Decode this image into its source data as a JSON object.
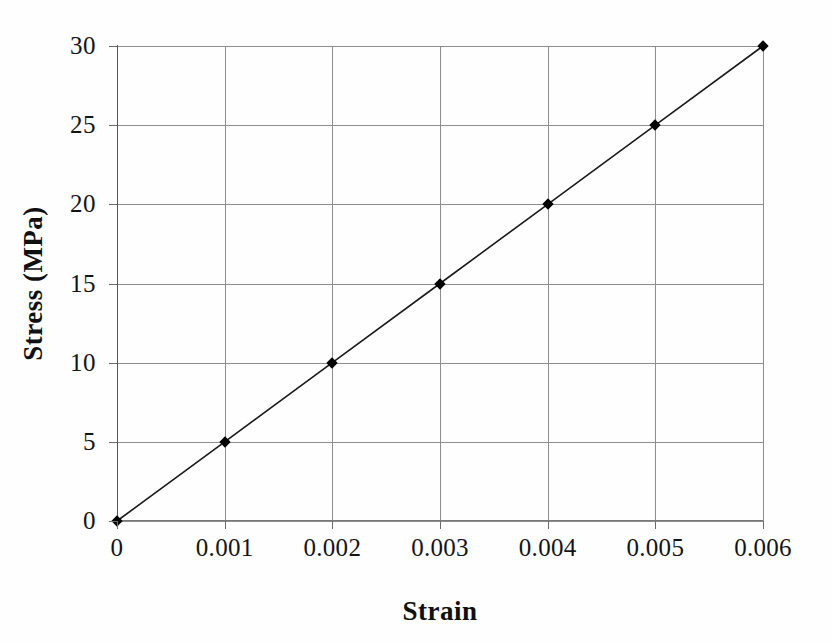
{
  "chart_data": {
    "type": "line",
    "title": "",
    "xlabel": "Strain",
    "ylabel": "Stress (MPa)",
    "xlim": [
      0,
      0.006
    ],
    "ylim": [
      0,
      30
    ],
    "grid": true,
    "legend": "none",
    "marker": "diamond",
    "line_color": "#1a1a1a",
    "marker_color": "#000000",
    "grid_color": "#8e8e8e",
    "background_color": "#fefefe",
    "x": [
      0,
      0.001,
      0.002,
      0.003,
      0.004,
      0.005,
      0.006
    ],
    "values": [
      0,
      5,
      10,
      15,
      20,
      25,
      30
    ],
    "series": [
      {
        "name": "Stress vs Strain",
        "x": [
          0,
          0.001,
          0.002,
          0.003,
          0.004,
          0.005,
          0.006
        ],
        "values": [
          0,
          5,
          10,
          15,
          20,
          25,
          30
        ]
      }
    ],
    "xticks": [
      0,
      0.001,
      0.002,
      0.003,
      0.004,
      0.005,
      0.006
    ],
    "xtick_labels": [
      "0",
      "0.001",
      "0.002",
      "0.003",
      "0.004",
      "0.005",
      "0.006"
    ],
    "yticks": [
      0,
      5,
      10,
      15,
      20,
      25,
      30
    ],
    "ytick_labels": [
      "0",
      "5",
      "10",
      "15",
      "20",
      "25",
      "30"
    ]
  }
}
